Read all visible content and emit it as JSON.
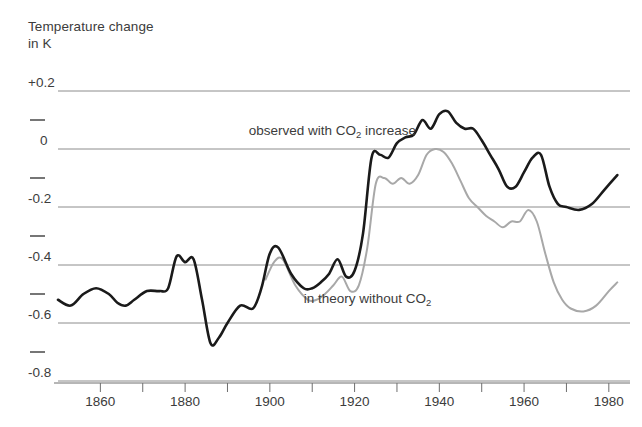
{
  "chart_data": {
    "type": "line",
    "title": "Temperature change in K",
    "title_lines": [
      "Temperature change",
      "in K"
    ],
    "xlabel": "year",
    "ylabel": "Temperature change in K",
    "xlim": [
      1850,
      1985
    ],
    "ylim": [
      -0.8,
      0.2
    ],
    "grid": true,
    "legend_position": "inline-annotations",
    "y_ticks_major": [
      "+0.2",
      "0",
      "-0.2",
      "-0.4",
      "-0.6",
      "-0.8"
    ],
    "y_tick_values": [
      0.2,
      0,
      -0.2,
      -0.4,
      -0.6,
      -0.8
    ],
    "y_ticks_minor": [
      0.1,
      -0.1,
      -0.3,
      -0.5,
      -0.7
    ],
    "x_ticks_labeled": [
      "1860",
      "1880",
      "1900",
      "1920",
      "1940",
      "1960",
      "1980"
    ],
    "x_tick_values": [
      1860,
      1880,
      1900,
      1920,
      1940,
      1960,
      1980
    ],
    "x_ticks_all": [
      1850,
      1860,
      1870,
      1880,
      1890,
      1900,
      1910,
      1920,
      1930,
      1940,
      1950,
      1960,
      1970,
      1980
    ],
    "annotations": [
      {
        "name": "observed-series-label",
        "text_before": "observed with CO",
        "sub": "2",
        "text_after": " increase",
        "x": 1895,
        "y": 0.06
      },
      {
        "name": "theory-series-label",
        "text_before": "in theory without CO",
        "sub": "2",
        "text_after": "",
        "x": 1908,
        "y": -0.52
      }
    ],
    "series": [
      {
        "name": "observed with CO2 increase",
        "color": "#1a1a1a",
        "x": [
          1850,
          1853,
          1856,
          1859,
          1862,
          1864,
          1866,
          1868,
          1871,
          1874,
          1876,
          1878,
          1880,
          1882,
          1884,
          1886,
          1888,
          1890,
          1893,
          1896,
          1898,
          1900,
          1902,
          1905,
          1908,
          1910,
          1912,
          1914,
          1916,
          1918,
          1920,
          1922,
          1924,
          1926,
          1928,
          1930,
          1932,
          1934,
          1936,
          1938,
          1940,
          1942,
          1944,
          1946,
          1948,
          1950,
          1952,
          1954,
          1956,
          1958,
          1960,
          1962,
          1964,
          1966,
          1968,
          1970,
          1973,
          1976,
          1979,
          1982
        ],
        "values": [
          -0.52,
          -0.54,
          -0.5,
          -0.48,
          -0.5,
          -0.53,
          -0.54,
          -0.52,
          -0.49,
          -0.49,
          -0.48,
          -0.37,
          -0.39,
          -0.38,
          -0.52,
          -0.67,
          -0.65,
          -0.6,
          -0.54,
          -0.55,
          -0.48,
          -0.36,
          -0.34,
          -0.43,
          -0.48,
          -0.48,
          -0.46,
          -0.43,
          -0.38,
          -0.44,
          -0.42,
          -0.29,
          -0.03,
          -0.02,
          -0.03,
          0.02,
          0.04,
          0.05,
          0.1,
          0.07,
          0.12,
          0.13,
          0.09,
          0.07,
          0.07,
          0.03,
          -0.02,
          -0.07,
          -0.13,
          -0.13,
          -0.08,
          -0.03,
          -0.02,
          -0.13,
          -0.19,
          -0.2,
          -0.21,
          -0.19,
          -0.14,
          -0.09
        ]
      },
      {
        "name": "in theory without CO2",
        "color": "#a8a8a8",
        "x": [
          1899,
          1901,
          1903,
          1906,
          1909,
          1911,
          1913,
          1915,
          1917,
          1919,
          1921,
          1923,
          1925,
          1927,
          1929,
          1931,
          1933,
          1935,
          1937,
          1939,
          1941,
          1943,
          1945,
          1947,
          1949,
          1951,
          1953,
          1955,
          1957,
          1959,
          1961,
          1963,
          1965,
          1967,
          1969,
          1971,
          1974,
          1977,
          1980,
          1982
        ],
        "values": [
          -0.45,
          -0.39,
          -0.38,
          -0.47,
          -0.52,
          -0.52,
          -0.5,
          -0.47,
          -0.44,
          -0.49,
          -0.47,
          -0.34,
          -0.12,
          -0.1,
          -0.12,
          -0.1,
          -0.12,
          -0.09,
          -0.02,
          0.0,
          -0.01,
          -0.05,
          -0.11,
          -0.17,
          -0.2,
          -0.23,
          -0.25,
          -0.27,
          -0.25,
          -0.25,
          -0.21,
          -0.25,
          -0.36,
          -0.46,
          -0.52,
          -0.55,
          -0.56,
          -0.54,
          -0.49,
          -0.46
        ]
      }
    ]
  },
  "geometry": {
    "plot_left": 58,
    "plot_right": 630,
    "x_min": 1850,
    "x_max": 1985,
    "y_top_px": 91,
    "y_bottom_px": 381,
    "y_top_val": 0.2,
    "y_bottom_val": -0.8
  },
  "colors": {
    "background": "#ffffff",
    "grid": "#8c8c8c",
    "axis": "#6e6e6e",
    "text": "#3c3c3c",
    "observed": "#1a1a1a",
    "theory": "#a8a8a8"
  }
}
